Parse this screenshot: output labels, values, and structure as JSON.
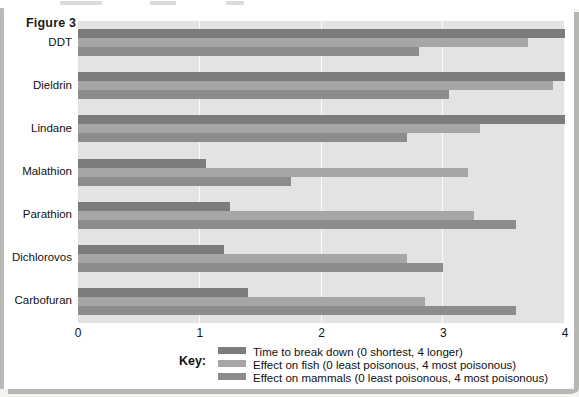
{
  "figure": {
    "title": "Figure 3"
  },
  "key": {
    "label": "Key:"
  },
  "chart_data": {
    "type": "bar",
    "orientation": "horizontal",
    "title": "Figure 3",
    "xlabel": "",
    "ylabel": "",
    "xlim": [
      0,
      4
    ],
    "xticks": [
      "0",
      "1",
      "2",
      "3",
      "4"
    ],
    "xtick_values": [
      0,
      1,
      2,
      3,
      4
    ],
    "grid": true,
    "legend_position": "bottom",
    "categories": [
      "DDT",
      "Dieldrin",
      "Lindane",
      "Malathion",
      "Parathion",
      "Dichlorovos",
      "Carbofuran"
    ],
    "series": [
      {
        "name": "Time to break down (0 shortest, 4 longer)",
        "color": "#7c7c7c",
        "values": [
          4.0,
          4.0,
          4.0,
          1.05,
          1.25,
          1.2,
          1.4
        ]
      },
      {
        "name": "Effect on fish (0 least poisonous, 4 most poisonous)",
        "color": "#a6a6a6",
        "values": [
          3.7,
          3.9,
          3.3,
          3.2,
          3.25,
          2.7,
          2.85
        ]
      },
      {
        "name": "Effect on mammals (0 least poisonous, 4 most poisonous)",
        "color": "#8c8c8c",
        "values": [
          2.8,
          3.05,
          2.7,
          1.75,
          3.6,
          3.0,
          3.6
        ]
      }
    ]
  }
}
